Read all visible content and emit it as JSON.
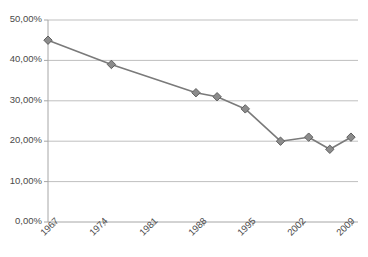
{
  "chart_data": {
    "type": "line",
    "title": "",
    "subtitle": "",
    "xlabel": "",
    "ylabel": "",
    "grid": true,
    "legend": false,
    "legend_position": "none",
    "xlim": [
      1967,
      2011
    ],
    "ylim": [
      0,
      50
    ],
    "y_tick_labels": [
      "0,00%",
      "10,00%",
      "20,00%",
      "30,00%",
      "40,00%",
      "50,00%"
    ],
    "y_tick_values": [
      0,
      10,
      20,
      30,
      40,
      50
    ],
    "x_tick_labels": [
      "1967",
      "1974",
      "1981",
      "1988",
      "1995",
      "2002",
      "2009"
    ],
    "x_tick_values": [
      1967,
      1974,
      1981,
      1988,
      1995,
      2002,
      2009
    ],
    "x": [
      1967,
      1976,
      1988,
      1991,
      1995,
      2000,
      2004,
      2007,
      2010
    ],
    "values": [
      45,
      39,
      32,
      31,
      28,
      20,
      21,
      18,
      21
    ],
    "series": [
      {
        "name": "Series 1",
        "x": [
          1967,
          1976,
          1988,
          1991,
          1995,
          2000,
          2004,
          2007,
          2010
        ],
        "values": [
          45,
          39,
          32,
          31,
          28,
          20,
          21,
          18,
          21
        ],
        "line_color": "#7a7a7a",
        "marker_color": "#8c8c8c",
        "marker_shape": "diamond"
      }
    ],
    "colors": {
      "line": "#7a7a7a",
      "marker_fill": "#8c8c8c",
      "marker_stroke": "#5f5f5f",
      "gridline": "#bfbfbf",
      "axis": "#a6a6a6",
      "tick_text": "#4a4a4a",
      "background": "#ffffff"
    }
  }
}
